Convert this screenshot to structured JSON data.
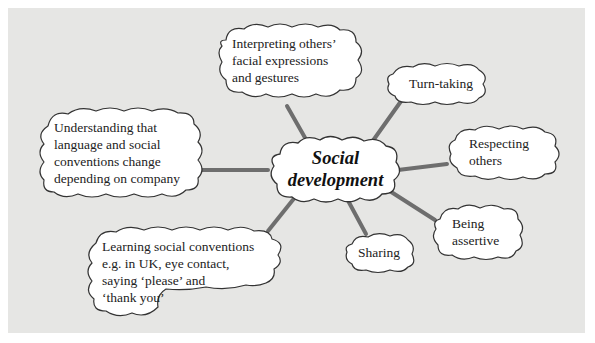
{
  "diagram": {
    "type": "mind-map",
    "colors": {
      "background": "#e6e6e4",
      "connector": "#6e6e6e",
      "cloud_fill": "#ffffff",
      "cloud_stroke": "#333333"
    },
    "center": {
      "label": "Social\ndevelopment"
    },
    "branches": [
      {
        "id": "interpreting",
        "label": "Interpreting others’\nfacial expressions\nand gestures"
      },
      {
        "id": "turn-taking",
        "label": "Turn-taking"
      },
      {
        "id": "respecting",
        "label": "Respecting\nothers"
      },
      {
        "id": "assertive",
        "label": "Being\nassertive"
      },
      {
        "id": "sharing",
        "label": "Sharing"
      },
      {
        "id": "learning",
        "label": "Learning social conventions\ne.g. in UK, eye contact,\nsaying ‘please’ and\n‘thank you’"
      },
      {
        "id": "understanding",
        "label": "Understanding that\nlanguage and social\nconventions change\ndepending on company"
      }
    ]
  }
}
